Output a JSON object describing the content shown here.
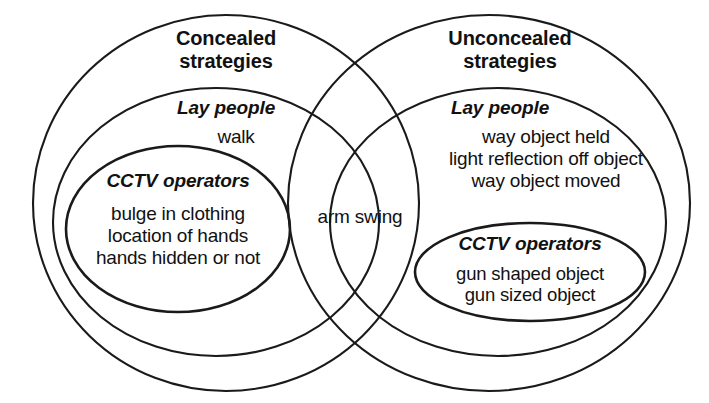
{
  "figure": {
    "type": "venn-diagram",
    "background_color": "#ffffff",
    "stroke_color": "#1a1a1a"
  },
  "left_set": {
    "title": "Concealed\nstrategies",
    "lay_people": {
      "heading": "Lay people",
      "items_text": "walk",
      "items": [
        "walk"
      ]
    },
    "cctv_operators": {
      "heading": "CCTV operators",
      "items_text": "bulge in clothing\nlocation of hands\nhands hidden or not",
      "items": [
        "bulge in clothing",
        "location of hands",
        "hands hidden or not"
      ]
    }
  },
  "right_set": {
    "title": "Unconcealed\nstrategies",
    "lay_people": {
      "heading": "Lay people",
      "items_text": "way object held\nlight reflection off object\nway object moved",
      "items": [
        "way object held",
        "light reflection off object",
        "way object moved"
      ]
    },
    "cctv_operators": {
      "heading": "CCTV operators",
      "items_text": "gun shaped object\ngun sized object",
      "items": [
        "gun shaped object",
        "gun sized object"
      ]
    }
  },
  "intersection": {
    "label": "arm swing",
    "items": [
      "arm swing"
    ]
  }
}
